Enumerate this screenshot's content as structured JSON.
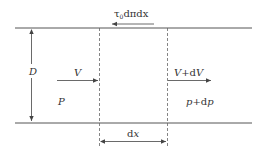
{
  "diagram": {
    "labels": {
      "shear_force": "τ",
      "shear_sub": "0",
      "shear_rest": "dπdx",
      "diameter": "D",
      "velocity_in": "V",
      "velocity_out_v": "V",
      "velocity_out_plus": "+d",
      "velocity_out_dv": "V",
      "pressure_in": "P",
      "pressure_out_p": "p",
      "pressure_out_plus": "+d",
      "pressure_out_dp": "p",
      "length_d": "d",
      "length_x": "x"
    },
    "colors": {
      "line": "#555555",
      "text": "#333333",
      "background": "#ffffff"
    }
  }
}
